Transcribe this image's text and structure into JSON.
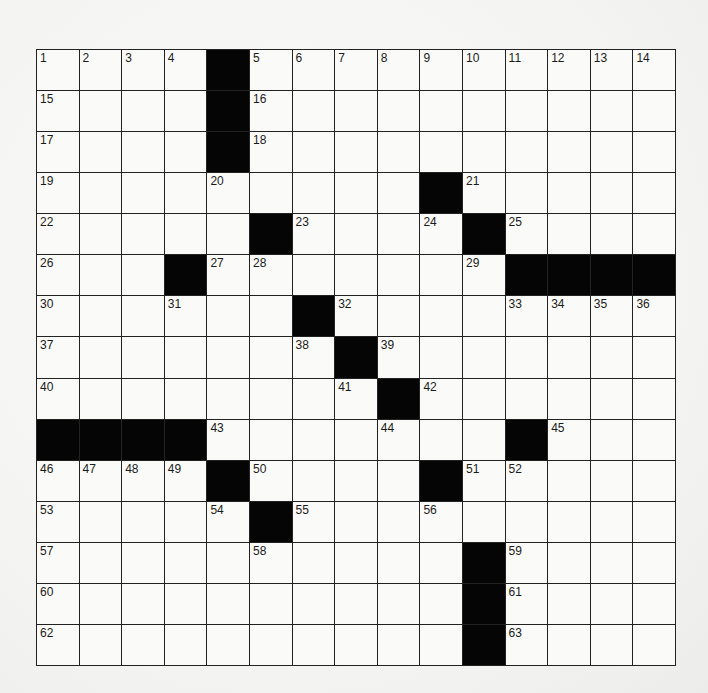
{
  "puzzle": {
    "rows": 15,
    "cols": 15,
    "colors": {
      "black": "#050505",
      "white": "#fafaf8",
      "line": "#222222"
    },
    "black_cells": [
      [
        0,
        4
      ],
      [
        1,
        4
      ],
      [
        2,
        4
      ],
      [
        3,
        9
      ],
      [
        4,
        5
      ],
      [
        4,
        10
      ],
      [
        5,
        3
      ],
      [
        5,
        11
      ],
      [
        5,
        12
      ],
      [
        5,
        13
      ],
      [
        5,
        14
      ],
      [
        6,
        6
      ],
      [
        7,
        7
      ],
      [
        8,
        8
      ],
      [
        9,
        0
      ],
      [
        9,
        1
      ],
      [
        9,
        2
      ],
      [
        9,
        3
      ],
      [
        9,
        11
      ],
      [
        10,
        4
      ],
      [
        10,
        9
      ],
      [
        11,
        5
      ],
      [
        12,
        10
      ],
      [
        13,
        10
      ],
      [
        14,
        10
      ]
    ],
    "numbers": [
      {
        "r": 0,
        "c": 0,
        "n": "1"
      },
      {
        "r": 0,
        "c": 1,
        "n": "2"
      },
      {
        "r": 0,
        "c": 2,
        "n": "3"
      },
      {
        "r": 0,
        "c": 3,
        "n": "4"
      },
      {
        "r": 0,
        "c": 5,
        "n": "5"
      },
      {
        "r": 0,
        "c": 6,
        "n": "6"
      },
      {
        "r": 0,
        "c": 7,
        "n": "7"
      },
      {
        "r": 0,
        "c": 8,
        "n": "8"
      },
      {
        "r": 0,
        "c": 9,
        "n": "9"
      },
      {
        "r": 0,
        "c": 10,
        "n": "10"
      },
      {
        "r": 0,
        "c": 11,
        "n": "11"
      },
      {
        "r": 0,
        "c": 12,
        "n": "12"
      },
      {
        "r": 0,
        "c": 13,
        "n": "13"
      },
      {
        "r": 0,
        "c": 14,
        "n": "14"
      },
      {
        "r": 1,
        "c": 0,
        "n": "15"
      },
      {
        "r": 1,
        "c": 5,
        "n": "16"
      },
      {
        "r": 2,
        "c": 0,
        "n": "17"
      },
      {
        "r": 2,
        "c": 5,
        "n": "18"
      },
      {
        "r": 3,
        "c": 0,
        "n": "19"
      },
      {
        "r": 3,
        "c": 4,
        "n": "20"
      },
      {
        "r": 3,
        "c": 10,
        "n": "21"
      },
      {
        "r": 4,
        "c": 0,
        "n": "22"
      },
      {
        "r": 4,
        "c": 6,
        "n": "23"
      },
      {
        "r": 4,
        "c": 9,
        "n": "24"
      },
      {
        "r": 4,
        "c": 11,
        "n": "25"
      },
      {
        "r": 5,
        "c": 0,
        "n": "26"
      },
      {
        "r": 5,
        "c": 4,
        "n": "27"
      },
      {
        "r": 5,
        "c": 5,
        "n": "28"
      },
      {
        "r": 5,
        "c": 10,
        "n": "29"
      },
      {
        "r": 6,
        "c": 0,
        "n": "30"
      },
      {
        "r": 6,
        "c": 3,
        "n": "31"
      },
      {
        "r": 6,
        "c": 7,
        "n": "32"
      },
      {
        "r": 6,
        "c": 11,
        "n": "33"
      },
      {
        "r": 6,
        "c": 12,
        "n": "34"
      },
      {
        "r": 6,
        "c": 13,
        "n": "35"
      },
      {
        "r": 6,
        "c": 14,
        "n": "36"
      },
      {
        "r": 7,
        "c": 0,
        "n": "37"
      },
      {
        "r": 7,
        "c": 6,
        "n": "38"
      },
      {
        "r": 7,
        "c": 8,
        "n": "39"
      },
      {
        "r": 8,
        "c": 0,
        "n": "40"
      },
      {
        "r": 8,
        "c": 7,
        "n": "41"
      },
      {
        "r": 8,
        "c": 9,
        "n": "42"
      },
      {
        "r": 9,
        "c": 4,
        "n": "43"
      },
      {
        "r": 9,
        "c": 8,
        "n": "44"
      },
      {
        "r": 9,
        "c": 12,
        "n": "45"
      },
      {
        "r": 10,
        "c": 0,
        "n": "46"
      },
      {
        "r": 10,
        "c": 1,
        "n": "47"
      },
      {
        "r": 10,
        "c": 2,
        "n": "48"
      },
      {
        "r": 10,
        "c": 3,
        "n": "49"
      },
      {
        "r": 10,
        "c": 5,
        "n": "50"
      },
      {
        "r": 10,
        "c": 10,
        "n": "51"
      },
      {
        "r": 10,
        "c": 11,
        "n": "52"
      },
      {
        "r": 11,
        "c": 0,
        "n": "53"
      },
      {
        "r": 11,
        "c": 4,
        "n": "54"
      },
      {
        "r": 11,
        "c": 6,
        "n": "55"
      },
      {
        "r": 11,
        "c": 9,
        "n": "56"
      },
      {
        "r": 12,
        "c": 0,
        "n": "57"
      },
      {
        "r": 12,
        "c": 5,
        "n": "58"
      },
      {
        "r": 12,
        "c": 11,
        "n": "59"
      },
      {
        "r": 13,
        "c": 0,
        "n": "60"
      },
      {
        "r": 13,
        "c": 11,
        "n": "61"
      },
      {
        "r": 14,
        "c": 0,
        "n": "62"
      },
      {
        "r": 14,
        "c": 11,
        "n": "63"
      }
    ]
  }
}
